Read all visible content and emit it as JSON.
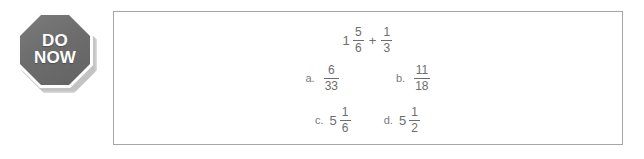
{
  "sign": {
    "name": "do-now-sign",
    "shape": "octagon",
    "line_1": "DO",
    "line_2": "NOW",
    "fill_color": "#6d6d6d",
    "ring_color": "#fdfdfd",
    "text_color": "#ffffff"
  },
  "problem": {
    "border_color": "#a7a7a7",
    "background_color": "#ffffff",
    "text_color": "#6d6d6d",
    "expression": {
      "whole": "1",
      "fraction_1": {
        "numerator": "5",
        "denominator": "6"
      },
      "operator": "+",
      "fraction_2": {
        "numerator": "1",
        "denominator": "3"
      }
    },
    "choices": [
      {
        "label": "a.",
        "whole": "",
        "numerator": "6",
        "denominator": "33"
      },
      {
        "label": "b.",
        "whole": "",
        "numerator": "11",
        "denominator": "18"
      },
      {
        "label": "c.",
        "whole": "5",
        "numerator": "1",
        "denominator": "6"
      },
      {
        "label": "d.",
        "whole": "5",
        "numerator": "1",
        "denominator": "2"
      }
    ]
  }
}
